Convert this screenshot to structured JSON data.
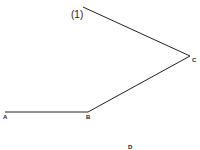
{
  "diagram": {
    "caption_label": "(1)",
    "points": [
      {
        "name": "A",
        "x": 5,
        "y": 112
      },
      {
        "name": "B",
        "x": 88,
        "y": 112
      },
      {
        "name": "C",
        "x": 190,
        "y": 56
      },
      {
        "name": "start",
        "x": 83,
        "y": 7
      }
    ],
    "labels": {
      "a": "A",
      "b": "B",
      "c": "C",
      "d": "D"
    },
    "segments": [
      {
        "from": "A",
        "to": "B"
      },
      {
        "from": "B",
        "to": "C"
      },
      {
        "from": "C",
        "to": "start"
      }
    ],
    "line_color": "#222222"
  }
}
